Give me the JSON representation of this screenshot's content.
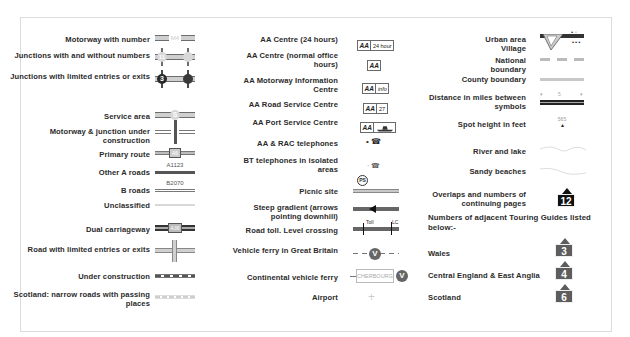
{
  "legend": {
    "column1": [
      {
        "label": "Motorway with number",
        "symbol": "motorway",
        "road_number": "M4"
      },
      {
        "label": "Junctions with and without numbers",
        "symbol": "junctions",
        "junction_number": "11"
      },
      {
        "label": "Junctions with limited entries or exits",
        "symbol": "limited-junctions",
        "junction_number": "3"
      },
      {
        "label": "Service area",
        "symbol": "service-area",
        "marker": "S"
      },
      {
        "label": "Motorway & junction under construction",
        "symbol": "motorway-construction"
      },
      {
        "label": "Primary route",
        "symbol": "primary-route",
        "road_number": "A6"
      },
      {
        "label": "Other A roads",
        "symbol": "a-road",
        "road_number": "A1123"
      },
      {
        "label": "B roads",
        "symbol": "b-road",
        "road_number": "B2070"
      },
      {
        "label": "Unclassified",
        "symbol": "unclassified"
      },
      {
        "label": "Dual carriageway",
        "symbol": "dual-carriageway",
        "road_number": "A38"
      },
      {
        "label": "Road with limited entries or exits",
        "symbol": "limited-road"
      },
      {
        "label": "Under construction",
        "symbol": "under-construction"
      },
      {
        "label": "Scotland: narrow roads with passing places",
        "symbol": "narrow-roads"
      }
    ],
    "column2": [
      {
        "label": "AA Centre (24 hours)",
        "symbol": "aa-24",
        "badge": "AA",
        "badge_extra": "24 hour"
      },
      {
        "label": "AA Centre (normal office hours)",
        "symbol": "aa-office",
        "badge": "AA"
      },
      {
        "label": "AA Motorway Information Centre",
        "symbol": "aa-info",
        "badge": "AA",
        "badge_extra": "info"
      },
      {
        "label": "AA Road Service Centre",
        "symbol": "aa-road-service",
        "badge": "AA",
        "badge_extra": "27"
      },
      {
        "label": "AA Port Service Centre",
        "symbol": "aa-port",
        "badge": "AA"
      },
      {
        "label": "AA & RAC telephones",
        "symbol": "aa-rac-phone"
      },
      {
        "label": "BT telephones in isolated areas",
        "symbol": "bt-phone"
      },
      {
        "label": "Picnic site",
        "symbol": "picnic",
        "marker": "PS"
      },
      {
        "label": "Steep gradient (arrows pointing downhill)",
        "symbol": "steep-gradient"
      },
      {
        "label": "Road toll. Level crossing",
        "symbol": "toll-crossing",
        "toll_label": "Toll",
        "crossing_label": "LC"
      },
      {
        "label": "Vehicle ferry in Great Britain",
        "symbol": "ferry-gb",
        "marker": "V"
      },
      {
        "label": "Continental vehicle ferry",
        "symbol": "ferry-continental",
        "destination": "CHERBOURG",
        "marker": "V"
      },
      {
        "label": "Airport",
        "symbol": "airport"
      }
    ],
    "column3": [
      {
        "label": "Urban area Village",
        "symbol": "urban-village"
      },
      {
        "label": "National boundary",
        "symbol": "national-boundary"
      },
      {
        "label": "County boundary",
        "symbol": "county-boundary"
      },
      {
        "label": "Distance in miles between symbols",
        "symbol": "distance",
        "value": "5"
      },
      {
        "label": "Spot height in feet",
        "symbol": "spot-height",
        "value": "565"
      },
      {
        "label": "River and lake",
        "symbol": "river-lake"
      },
      {
        "label": "Sandy beaches",
        "symbol": "sandy-beaches"
      },
      {
        "label": "Overlaps and numbers of continuing pages",
        "symbol": "page-overlap",
        "value": "12"
      }
    ],
    "touring_guides": {
      "heading": "Numbers of adjacent Touring Guides listed below:-",
      "items": [
        {
          "label": "Wales",
          "number": "3"
        },
        {
          "label": "Central England & East Anglia",
          "number": "4"
        },
        {
          "label": "Scotland",
          "number": "6"
        }
      ]
    }
  },
  "colors": {
    "road_dark": "#4a4a4a",
    "road_mid": "#8a8a8a",
    "road_light": "#cfcfcf",
    "badge": "#5d5d5d",
    "badge_dark": "#111111",
    "border": "#dcdcdc"
  }
}
